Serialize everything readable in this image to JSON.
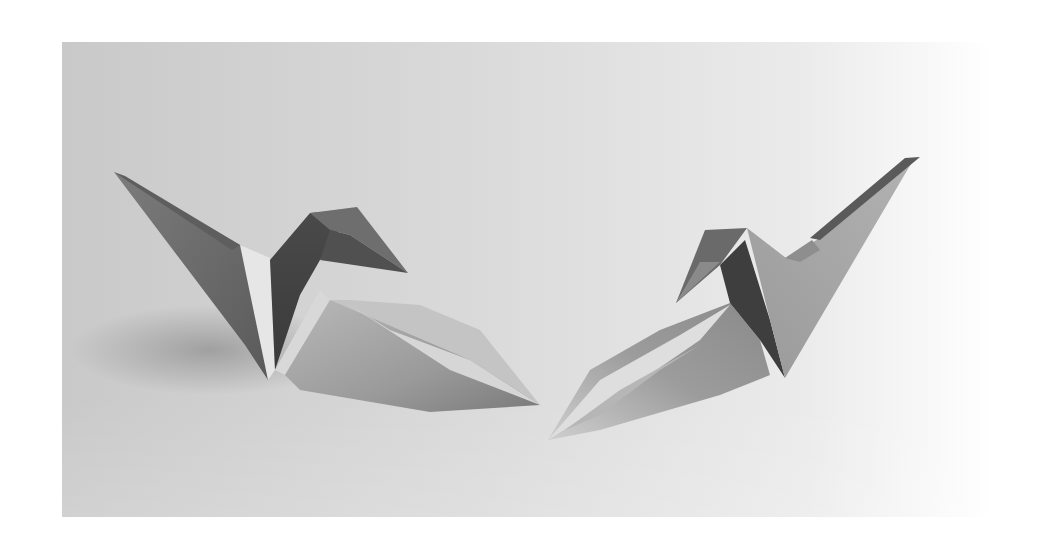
{
  "image": {
    "description": "Black-and-white photograph of two origami paper cranes facing each other on a light gray surface",
    "subjects": [
      {
        "name": "left-crane",
        "facing": "right"
      },
      {
        "name": "right-crane",
        "facing": "left"
      }
    ],
    "colors": {
      "page_background": "#ffffff",
      "surface": "#d2d2d2",
      "surface_light": "#f2f2f2",
      "paper_dark": "#6a6a6a",
      "paper_mid": "#a0a0a0",
      "paper_light": "#dcdcdc",
      "shadow": "#8a8a8a"
    }
  }
}
